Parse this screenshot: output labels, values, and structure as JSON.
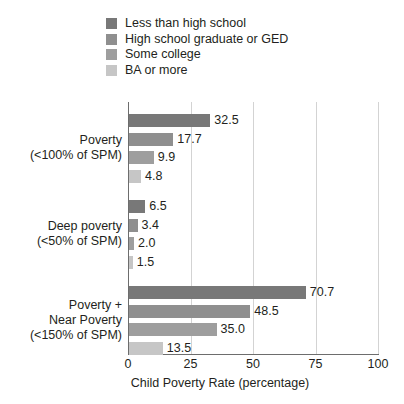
{
  "chart_data": {
    "type": "bar",
    "orientation": "horizontal",
    "title": "",
    "xlabel": "Child Poverty Rate (percentage)",
    "ylabel": "",
    "xlim": [
      0,
      100
    ],
    "xticks": [
      0,
      25,
      50,
      75,
      100
    ],
    "grid": true,
    "legend_position": "top-left",
    "categories": [
      "Poverty (<100% of SPM)",
      "Deep poverty (<50% of SPM)",
      "Poverty + Near Poverty (<150% of SPM)"
    ],
    "category_lines": [
      [
        "Poverty",
        "(<100% of SPM)"
      ],
      [
        "Deep poverty",
        "(<50% of SPM)"
      ],
      [
        "Poverty +",
        "Near Poverty",
        "(<150% of SPM)"
      ]
    ],
    "series": [
      {
        "name": "Less than high school",
        "color": "#787878",
        "values": [
          32.5,
          6.5,
          70.7
        ]
      },
      {
        "name": "High school graduate or GED",
        "color": "#8f8f8f",
        "values": [
          17.7,
          3.4,
          48.5
        ]
      },
      {
        "name": "Some college",
        "color": "#9e9e9e",
        "values": [
          9.9,
          2.0,
          35.0
        ]
      },
      {
        "name": "BA or more",
        "color": "#c6c6c6",
        "values": [
          4.8,
          1.5,
          13.5
        ]
      }
    ],
    "value_labels": [
      [
        "32.5",
        "17.7",
        "9.9",
        "4.8"
      ],
      [
        "6.5",
        "3.4",
        "2.0",
        "1.5"
      ],
      [
        "70.7",
        "48.5",
        "35.0",
        "13.5"
      ]
    ],
    "axis_color": "#6d6d6d",
    "gridline_color": "#d3d3d3",
    "text_color": "#231f20",
    "background": "#ffffff"
  },
  "legend": {
    "items": [
      {
        "label": "Less than high school",
        "color": "#787878"
      },
      {
        "label": "High school graduate or GED",
        "color": "#8f8f8f"
      },
      {
        "label": "Some college",
        "color": "#9e9e9e"
      },
      {
        "label": "BA or more",
        "color": "#c6c6c6"
      }
    ]
  },
  "xaxis": {
    "ticks": [
      "0",
      "25",
      "50",
      "75",
      "100"
    ],
    "title": "Child Poverty Rate (percentage)"
  }
}
